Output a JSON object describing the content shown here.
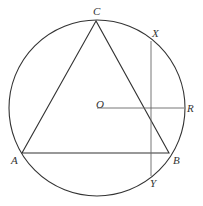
{
  "diagram": {
    "type": "geometry",
    "colors": {
      "stroke": "#333333",
      "thin_stroke": "#666666",
      "background": "#ffffff"
    },
    "circle": {
      "center": "O",
      "cx": 97,
      "cy": 108,
      "r": 88
    },
    "points": {
      "A": {
        "label": "A",
        "x": 22,
        "y": 153
      },
      "B": {
        "label": "B",
        "x": 169,
        "y": 153
      },
      "C": {
        "label": "C",
        "x": 96,
        "y": 21
      },
      "O": {
        "label": "O",
        "x": 97,
        "y": 108
      },
      "R": {
        "label": "R",
        "x": 184,
        "y": 108
      },
      "X": {
        "label": "X",
        "x": 151,
        "y": 41
      },
      "Y": {
        "label": "Y",
        "x": 151,
        "y": 176
      }
    },
    "segments": [
      {
        "from": "A",
        "to": "B"
      },
      {
        "from": "B",
        "to": "C"
      },
      {
        "from": "C",
        "to": "A"
      },
      {
        "from": "O",
        "to": "R"
      },
      {
        "from": "X",
        "to": "Y"
      }
    ]
  }
}
